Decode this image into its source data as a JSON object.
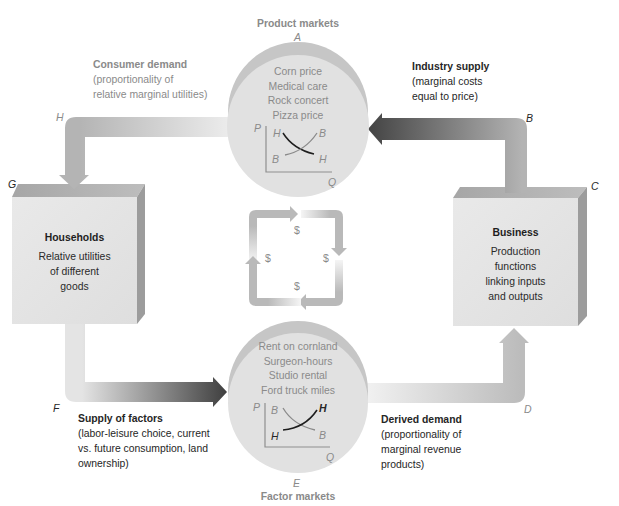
{
  "product_markets": {
    "title": "Product markets",
    "point_label": "A",
    "items": [
      "Corn price",
      "Medical care",
      "Rock concert",
      "Pizza price"
    ],
    "chart_labels": {
      "y_axis": "P",
      "x_axis": "Q",
      "top_left": "H",
      "top_right": "B",
      "bottom_left": "B",
      "bottom_right": "H"
    }
  },
  "factor_markets": {
    "title": "Factor markets",
    "point_label": "E",
    "items": [
      "Rent on cornland",
      "Surgeon-hours",
      "Studio rental",
      "Ford truck miles"
    ],
    "chart_labels": {
      "y_axis": "P",
      "x_axis": "Q",
      "top_left": "B",
      "top_right": "H",
      "bottom_left": "H",
      "bottom_right": "B"
    }
  },
  "households": {
    "title": "Households",
    "lines": [
      "Relative utilities",
      "of different",
      "goods"
    ],
    "point_label": "G"
  },
  "business": {
    "title": "Business",
    "lines": [
      "Production",
      "functions",
      "linking inputs",
      "and outputs"
    ],
    "point_label": "C"
  },
  "flows": {
    "consumer_demand": {
      "title": "Consumer demand",
      "lines": [
        "(proportionality of",
        "relative marginal utilities)"
      ],
      "point_label": "H"
    },
    "industry_supply": {
      "title": "Industry supply",
      "lines": [
        "(marginal costs",
        "equal to price)"
      ],
      "point_label": "B"
    },
    "supply_of_factors": {
      "title": "Supply of factors",
      "lines": [
        "(labor-leisure choice, current",
        "vs. future consumption, land",
        "ownership)"
      ],
      "point_label": "F"
    },
    "derived_demand": {
      "title": "Derived demand",
      "lines": [
        "(proportionality of",
        "marginal revenue",
        "products)"
      ],
      "point_label": "D"
    }
  },
  "money_loop": {
    "top": "$",
    "right": "$",
    "bottom": "$",
    "left": "$"
  },
  "colors": {
    "circle_face": "#e1e1e1",
    "circle_rim": "#c6c6c6",
    "box_front": "#e5e5e5",
    "box_top": "#adadad",
    "box_side": "#9c9c9c",
    "arrow_dark": "#454545",
    "arrow_light": "#ececec",
    "muted_text": "#8a8a8a"
  }
}
